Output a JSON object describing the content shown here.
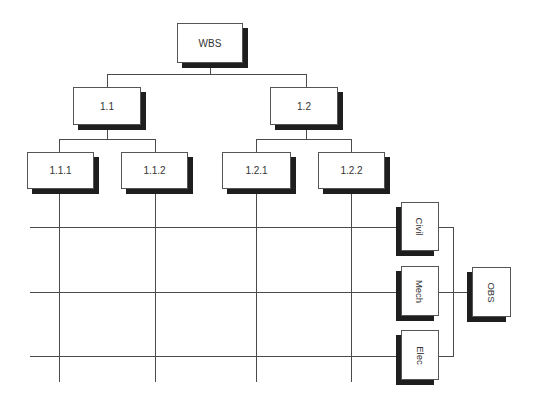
{
  "diagram": {
    "wbs": {
      "root": {
        "label": "WBS"
      },
      "level1": [
        {
          "label": "1.1"
        },
        {
          "label": "1.2"
        }
      ],
      "level2": [
        {
          "label": "1.1.1"
        },
        {
          "label": "1.1.2"
        },
        {
          "label": "1.2.1"
        },
        {
          "label": "1.2.2"
        }
      ]
    },
    "obs": {
      "root": {
        "label": "OBS"
      },
      "units": [
        {
          "label": "Civil"
        },
        {
          "label": "Mech"
        },
        {
          "label": "Elec"
        }
      ]
    },
    "colors": {
      "line": "#4a4a4a",
      "box_border": "#555555",
      "shadow": "#1e1e1e",
      "text": "#333333"
    }
  }
}
